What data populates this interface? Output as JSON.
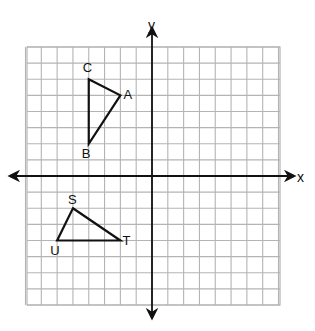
{
  "diagram": {
    "type": "coordinate-plane",
    "grid": {
      "x_min": -8,
      "x_max": 8,
      "y_min": -8,
      "y_max": 8,
      "step": 1,
      "line_color": "#b4b4b4",
      "background": "#ffffff"
    },
    "axes": {
      "x_label": "x",
      "y_label": "y",
      "color": "#111111"
    },
    "shapes": [
      {
        "name": "triangle-abc",
        "stroke": "#111111",
        "vertices": [
          {
            "label": "C",
            "x": -4,
            "y": 6,
            "label_dx": -6,
            "label_dy": -7
          },
          {
            "label": "A",
            "x": -2,
            "y": 5,
            "label_dx": 3,
            "label_dy": 4
          },
          {
            "label": "B",
            "x": -4,
            "y": 2,
            "label_dx": -7,
            "label_dy": 14
          }
        ]
      },
      {
        "name": "triangle-stu",
        "stroke": "#111111",
        "vertices": [
          {
            "label": "S",
            "x": -5,
            "y": -2,
            "label_dx": -5,
            "label_dy": -4
          },
          {
            "label": "T",
            "x": -2,
            "y": -4,
            "label_dx": 2,
            "label_dy": 4
          },
          {
            "label": "U",
            "x": -6,
            "y": -4,
            "label_dx": -7,
            "label_dy": 14
          }
        ]
      }
    ]
  }
}
